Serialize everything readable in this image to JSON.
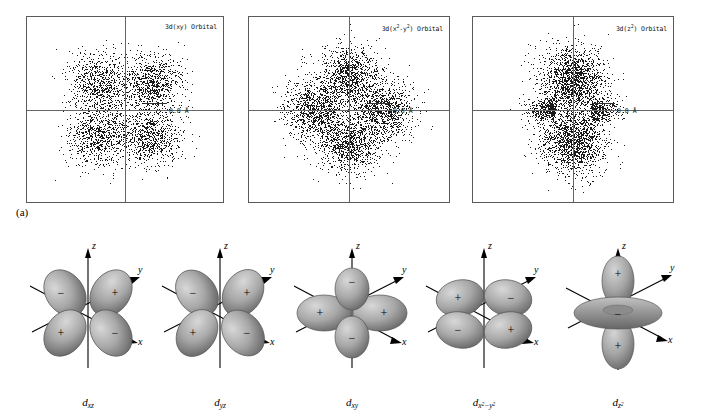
{
  "figure": {
    "panel_a_label": "(a)",
    "panel_b_label": "(b)"
  },
  "density_plots": [
    {
      "id": "3d-xy",
      "title_prefix": "3d(xy) Orbital",
      "title_base": "3d(xy)",
      "title_suffix": " Orbital",
      "scale_label": "0.8 Å",
      "pattern": "lobes-between-axes",
      "dot_count": 3400
    },
    {
      "id": "3d-x2-y2",
      "title_prefix": "3d(x",
      "title_sup1": "2",
      "title_mid": "-y",
      "title_sup2": "2",
      "title_suffix": ") Orbital",
      "scale_label": "0.8 Å",
      "pattern": "lobes-on-axes",
      "dot_count": 4200
    },
    {
      "id": "3d-z2",
      "title_prefix": "3d(z",
      "title_sup1": "2",
      "title_suffix": ") Orbital",
      "scale_label": "0.8 Å",
      "pattern": "dz2-vertical-lobes-with-belt",
      "dot_count": 4000
    }
  ],
  "orbital_shapes": [
    {
      "id": "dxz",
      "name_base": "d",
      "name_sub": "xz",
      "type": "cloverleaf-diagonal",
      "axes": [
        "z",
        "y",
        "x"
      ],
      "signs": {
        "upper_left": "−",
        "upper_right": "+",
        "lower_left": "+",
        "lower_right": "−"
      }
    },
    {
      "id": "dyz",
      "name_base": "d",
      "name_sub": "yz",
      "type": "cloverleaf-diagonal",
      "axes": [
        "z",
        "y",
        "x"
      ],
      "signs": {
        "upper_left": "−",
        "upper_right": "+",
        "lower_left": "+",
        "lower_right": "−"
      }
    },
    {
      "id": "dxy",
      "name_base": "d",
      "name_sub": "xy",
      "type": "cloverleaf-upright",
      "axes": [
        "z",
        "y",
        "x"
      ],
      "signs": {
        "top": "−",
        "left": "+",
        "right": "+",
        "bottom": "−"
      }
    },
    {
      "id": "dx2-y2",
      "name_base": "d",
      "name_sub_pre": "x",
      "name_sub_sup1": "2",
      "name_sub_mid": "−y",
      "name_sub_sup2": "2",
      "type": "cloverleaf-horizontal",
      "axes": [
        "z",
        "y",
        "x"
      ],
      "signs": {
        "upper_left": "+",
        "upper_right": "−",
        "lower_left": "−",
        "lower_right": "+"
      }
    },
    {
      "id": "dz2",
      "name_base": "d",
      "name_sub_pre": "z",
      "name_sub_sup1": "2",
      "type": "dumbbell-with-torus",
      "axes": [
        "z",
        "y",
        "x"
      ],
      "signs": {
        "top_lobe": "+",
        "torus": "−",
        "bottom_lobe": "+"
      }
    }
  ],
  "colors": {
    "dot": "#1a1a1a",
    "axis": "#666666",
    "frame": "#5a5a5a",
    "lobe_light": "#c9c9c9",
    "lobe_mid": "#9a9a9a",
    "lobe_dark": "#6e6e6e",
    "text": "#000000"
  }
}
